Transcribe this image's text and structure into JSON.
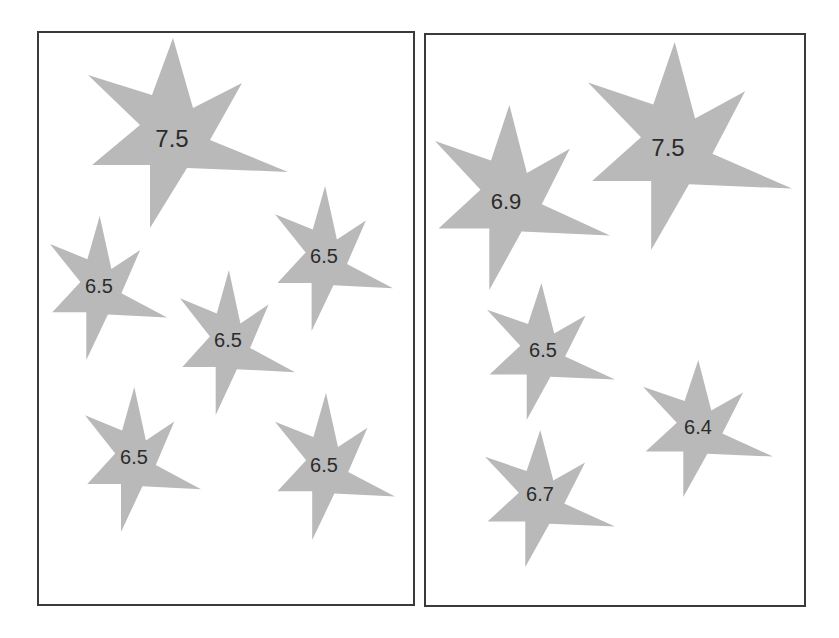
{
  "figure": {
    "colors": {
      "star_fill": "#b9b9b9",
      "label_text": "#2b2b2b",
      "panel_border": "#3a3a3a",
      "background": "#ffffff"
    }
  },
  "panels": [
    {
      "id": "left",
      "box": {
        "x": 37,
        "y": 31,
        "w": 378,
        "h": 575
      },
      "stars": [
        {
          "label": "7.5",
          "x": 88,
          "y": 38,
          "w": 200,
          "h": 190,
          "tx": 172,
          "ty": 138,
          "fs": 24
        },
        {
          "label": "6.5",
          "x": 50,
          "y": 216,
          "w": 117,
          "h": 144,
          "tx": 99,
          "ty": 286,
          "fs": 20
        },
        {
          "label": "6.5",
          "x": 275,
          "y": 186,
          "w": 118,
          "h": 145,
          "tx": 324,
          "ty": 256,
          "fs": 20
        },
        {
          "label": "6.5",
          "x": 180,
          "y": 270,
          "w": 115,
          "h": 145,
          "tx": 228,
          "ty": 340,
          "fs": 20
        },
        {
          "label": "6.5",
          "x": 85,
          "y": 387,
          "w": 116,
          "h": 145,
          "tx": 134,
          "ty": 457,
          "fs": 20
        },
        {
          "label": "6.5",
          "x": 275,
          "y": 393,
          "w": 120,
          "h": 147,
          "tx": 324,
          "ty": 465,
          "fs": 20
        }
      ]
    },
    {
      "id": "right",
      "box": {
        "x": 424,
        "y": 33,
        "w": 382,
        "h": 574
      },
      "stars": [
        {
          "label": "6.9",
          "x": 435,
          "y": 105,
          "w": 175,
          "h": 185,
          "tx": 506,
          "ty": 201,
          "fs": 22
        },
        {
          "label": "7.5",
          "x": 588,
          "y": 42,
          "w": 204,
          "h": 208,
          "tx": 668,
          "ty": 147,
          "fs": 24
        },
        {
          "label": "6.5",
          "x": 487,
          "y": 283,
          "w": 128,
          "h": 137,
          "tx": 543,
          "ty": 350,
          "fs": 20
        },
        {
          "label": "6.4",
          "x": 643,
          "y": 360,
          "w": 130,
          "h": 137,
          "tx": 698,
          "ty": 427,
          "fs": 20
        },
        {
          "label": "6.7",
          "x": 485,
          "y": 430,
          "w": 130,
          "h": 137,
          "tx": 540,
          "ty": 494,
          "fs": 20
        }
      ]
    }
  ]
}
